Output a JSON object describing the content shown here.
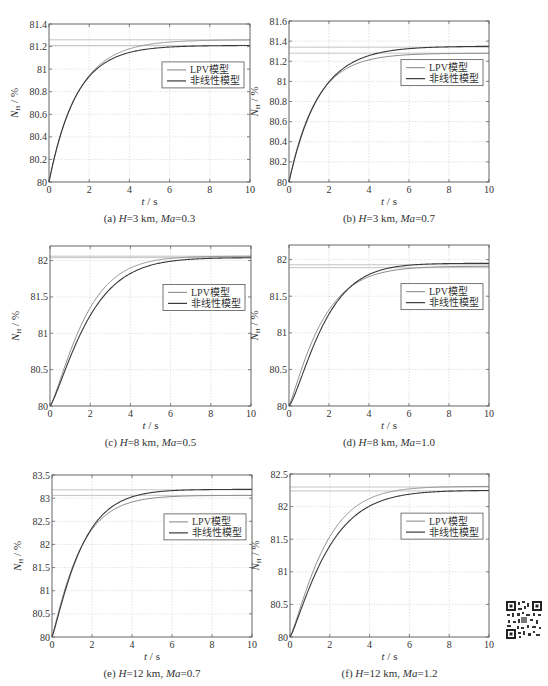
{
  "legend": {
    "lpv": "LPV模型",
    "nonlinear": "非线性模型"
  },
  "colors": {
    "lpv": "#8f8f8f",
    "nonlinear": "#3a3a3a",
    "grid": "#d0d0d0",
    "ref_line": "#b5b5b5"
  },
  "chart_data": [
    {
      "id": "a",
      "type": "line",
      "title": "(a) H=3 km, Ma=0.3",
      "caption_parts": [
        "(a) ",
        "H",
        "=3 km, ",
        "Ma",
        "=0.3"
      ],
      "xlabel": "t / s",
      "ylabel": "N_H / %",
      "xlim": [
        0,
        10
      ],
      "ylim": [
        80,
        81.4
      ],
      "xticks": [
        0,
        2,
        4,
        6,
        8,
        10
      ],
      "yticks": [
        80,
        80.2,
        80.4,
        80.6,
        80.8,
        81,
        81.2,
        81.4
      ],
      "ytick_labels": [
        "80",
        "80.2",
        "80.4",
        "80.6",
        "80.8",
        "81",
        "81.2",
        "81.4"
      ],
      "grid": true,
      "legend_position": "upper right (below reference lines)",
      "series": [
        {
          "name": "LPV模型",
          "final": 81.26,
          "tau": 1.45,
          "shape": 1.0
        },
        {
          "name": "非线性模型",
          "final": 81.21,
          "tau": 1.35,
          "shape": 1.0
        }
      ],
      "reference_lines": [
        81.26,
        81.21
      ],
      "frame": {
        "left": 49,
        "top": 24,
        "right": 250,
        "bottom": 182
      }
    },
    {
      "id": "b",
      "type": "line",
      "title": "(b) H=3 km, Ma=0.7",
      "caption_parts": [
        "(b) ",
        "H",
        "=3 km, ",
        "Ma",
        "=0.7"
      ],
      "xlabel": "t / s",
      "ylabel": "N_H / %",
      "xlim": [
        0,
        10
      ],
      "ylim": [
        80,
        81.6
      ],
      "xticks": [
        0,
        2,
        4,
        6,
        8,
        10
      ],
      "yticks": [
        80,
        80.2,
        80.4,
        80.6,
        80.8,
        81,
        81.2,
        81.4,
        81.6
      ],
      "ytick_labels": [
        "80",
        "80.2",
        "80.4",
        "80.6",
        "80.8",
        "81",
        "81.2",
        "81.4",
        "81.6"
      ],
      "grid": true,
      "legend_position": "upper right (below reference lines)",
      "series": [
        {
          "name": "LPV模型",
          "final": 81.28,
          "tau": 1.35,
          "shape": 1.0
        },
        {
          "name": "非线性模型",
          "final": 81.35,
          "tau": 1.5,
          "shape": 1.0
        }
      ],
      "reference_lines": [
        81.34,
        81.28
      ],
      "frame": {
        "left": 289,
        "top": 21,
        "right": 489,
        "bottom": 182
      }
    },
    {
      "id": "c",
      "type": "line",
      "title": "(c) H=8 km, Ma=0.5",
      "caption_parts": [
        "(c) ",
        "H",
        "=8 km, ",
        "Ma",
        "=0.5"
      ],
      "xlabel": "t / s",
      "ylabel": "N_H / %",
      "xlim": [
        0,
        10
      ],
      "ylim": [
        80,
        82.2
      ],
      "xticks": [
        0,
        2,
        4,
        6,
        8,
        10
      ],
      "yticks": [
        80,
        80.5,
        81,
        81.5,
        82
      ],
      "ytick_labels": [
        "80",
        "80.5",
        "81",
        "81.5",
        "82"
      ],
      "grid": true,
      "legend_position": "upper right (below reference lines)",
      "series": [
        {
          "name": "LPV模型",
          "final": 82.06,
          "tau": 1.9,
          "shape": 1.25
        },
        {
          "name": "非线性模型",
          "final": 82.04,
          "tau": 2.1,
          "shape": 1.25
        }
      ],
      "reference_lines": [
        82.06,
        82.04
      ],
      "frame": {
        "left": 50,
        "top": 246,
        "right": 251,
        "bottom": 406
      }
    },
    {
      "id": "d",
      "type": "line",
      "title": "(d) H=8 km, Ma=1.0",
      "caption_parts": [
        "(d) ",
        "H",
        "=8 km, ",
        "Ma",
        "=1.0"
      ],
      "xlabel": "t / s",
      "ylabel": "N_H / %",
      "xlim": [
        0,
        10
      ],
      "ylim": [
        80,
        82.2
      ],
      "xticks": [
        0,
        2,
        4,
        6,
        8,
        10
      ],
      "yticks": [
        80,
        80.5,
        81,
        81.5,
        82
      ],
      "ytick_labels": [
        "80",
        "80.5",
        "81",
        "81.5",
        "82"
      ],
      "grid": true,
      "legend_position": "upper right (below reference lines)",
      "series": [
        {
          "name": "LPV模型",
          "final": 81.91,
          "tau": 1.75,
          "shape": 1.15
        },
        {
          "name": "非线性模型",
          "final": 81.95,
          "tau": 1.95,
          "shape": 1.3
        }
      ],
      "reference_lines": [
        81.93,
        81.89
      ],
      "frame": {
        "left": 289,
        "top": 245,
        "right": 489,
        "bottom": 406
      }
    },
    {
      "id": "e",
      "type": "line",
      "title": "(e) H=12 km, Ma=0.7",
      "caption_parts": [
        "(e) ",
        "H",
        "=12 km, ",
        "Ma",
        "=0.7"
      ],
      "xlabel": "t / s",
      "ylabel": "N_H / %",
      "xlim": [
        0,
        10
      ],
      "ylim": [
        80,
        83.5
      ],
      "xticks": [
        0,
        2,
        4,
        6,
        8,
        10
      ],
      "yticks": [
        80,
        80.5,
        81,
        81.5,
        82,
        82.5,
        83,
        83.5
      ],
      "ytick_labels": [
        "80",
        "80.5",
        "81",
        "81.5",
        "82",
        "82.5",
        "83",
        "83.5"
      ],
      "grid": true,
      "legend_position": "upper right (below reference lines)",
      "series": [
        {
          "name": "LPV模型",
          "final": 83.06,
          "tau": 1.45,
          "shape": 1.1
        },
        {
          "name": "非线性模型",
          "final": 83.19,
          "tau": 1.55,
          "shape": 1.15
        }
      ],
      "reference_lines": [
        83.18,
        83.06
      ],
      "frame": {
        "left": 52,
        "top": 475,
        "right": 252,
        "bottom": 637
      }
    },
    {
      "id": "f",
      "type": "line",
      "title": "(f) H=12 km, Ma=1.2",
      "caption_parts": [
        "(f) ",
        "H",
        "=12 km, ",
        "Ma",
        "=1.2"
      ],
      "xlabel": "t / s",
      "ylabel": "N_H / %",
      "xlim": [
        0,
        10
      ],
      "ylim": [
        80,
        82.5
      ],
      "xticks": [
        0,
        2,
        4,
        6,
        8,
        10
      ],
      "yticks": [
        80,
        80.5,
        81,
        81.5,
        82,
        82.5
      ],
      "ytick_labels": [
        "80",
        "80.5",
        "81",
        "81.5",
        "82",
        "82.5"
      ],
      "grid": true,
      "legend_position": "upper right (below reference lines)",
      "series": [
        {
          "name": "LPV模型",
          "final": 82.31,
          "tau": 1.85,
          "shape": 1.2
        },
        {
          "name": "非线性模型",
          "final": 82.25,
          "tau": 2.05,
          "shape": 1.2
        }
      ],
      "reference_lines": [
        82.3,
        82.24
      ],
      "frame": {
        "left": 290,
        "top": 474,
        "right": 489,
        "bottom": 637
      }
    }
  ]
}
